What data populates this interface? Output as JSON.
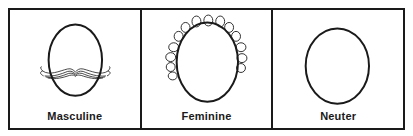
{
  "figure": {
    "panels": [
      {
        "id": "masculine",
        "label": "Masculine",
        "icon": "face-with-mustache"
      },
      {
        "id": "feminine",
        "label": "Feminine",
        "icon": "face-with-curls"
      },
      {
        "id": "neuter",
        "label": "Neuter",
        "icon": "plain-face-oval"
      }
    ],
    "colors": {
      "ink": "#1a1a1a",
      "background": "#ffffff"
    }
  }
}
